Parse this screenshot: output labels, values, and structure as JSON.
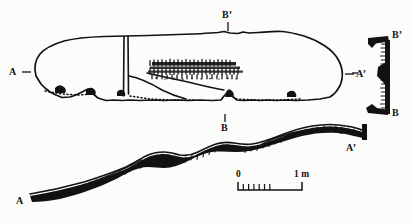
{
  "figure": {
    "type": "archaeological-plan-and-section",
    "background_color": "#fcfcfa",
    "ink_color": "#141210",
    "width_px": 410,
    "height_px": 223
  },
  "plan": {
    "name": "plan-view",
    "section_markers": {
      "a_left": "A",
      "a_right": "A’",
      "b_top": "B’"
    }
  },
  "cross_section_bb": {
    "name": "section-b-b",
    "top_label": "B’",
    "bottom_label": "B",
    "side_label": "A’"
  },
  "long_section_aa": {
    "name": "section-a-a",
    "left_label": "A",
    "right_label": "A’",
    "mid_label": "B"
  },
  "scale_bar": {
    "name": "scale-bar",
    "zero_label": "0",
    "end_label": "1 m",
    "minor_tick_count": 6,
    "units": "m"
  }
}
